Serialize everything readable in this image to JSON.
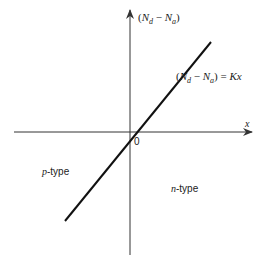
{
  "diagram": {
    "y_axis_label": {
      "open": "(",
      "N": "N",
      "d": "d",
      "minus": " − ",
      "N2": "N",
      "a": "a",
      "close": ")"
    },
    "line_label": {
      "open": "(",
      "N": "N",
      "d": "d",
      "minus": " − ",
      "N2": "N",
      "a": "a",
      "close": ")",
      "eq": " = ",
      "K": "Kx"
    },
    "x_axis_label": "x",
    "origin_label": "0",
    "region_left": {
      "italic": "p",
      "rest": "-type"
    },
    "region_right": {
      "italic": "n",
      "rest": "-type"
    },
    "colors": {
      "axis": "#333333",
      "line": "#111111",
      "text": "#222222"
    }
  }
}
